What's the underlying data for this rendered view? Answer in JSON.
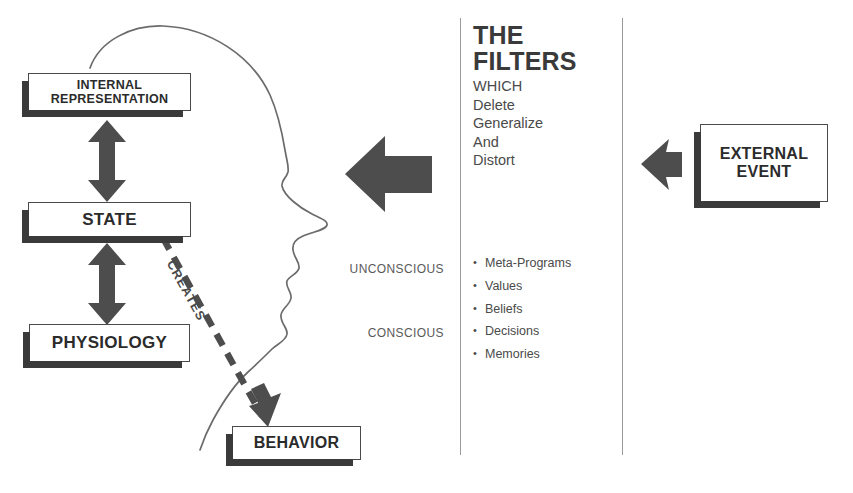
{
  "diagram": {
    "colors": {
      "ink": "#3a3a3a",
      "box_border": "#4a4a4a",
      "shadow": "#3a3a3a",
      "rule": "#9a9a9a",
      "arrow_fill": "#4d4d4d",
      "outline": "#6b6b6b"
    }
  },
  "boxes": {
    "internal_representation": "INTERNAL\nREPRESENTATION",
    "internal_representation_line1": "INTERNAL",
    "internal_representation_line2": "REPRESENTATION",
    "state": "STATE",
    "physiology": "PHYSIOLOGY",
    "behavior": "BEHAVIOR",
    "external_event_line1": "EXTERNAL",
    "external_event_line2": "EVENT"
  },
  "filters": {
    "title_line1": "THE",
    "title_line2": "FILTERS",
    "sub": [
      "WHICH",
      "Delete",
      "Generalize",
      "And",
      "Distort"
    ],
    "items": [
      "Meta-Programs",
      "Values",
      "Beliefs",
      "Decisions",
      "Memories"
    ]
  },
  "labels": {
    "unconscious": "UNCONSCIOUS",
    "conscious": "CONSCIOUS",
    "creates": "CREATES"
  }
}
